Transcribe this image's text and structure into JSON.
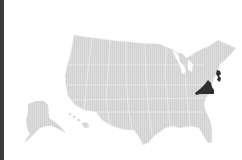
{
  "map": {
    "type": "us-states-choropleth",
    "highlighted_states": [
      "Virginia",
      "New Jersey"
    ],
    "colors": {
      "highlight": "#2e2e2e",
      "default": "#d9d9d9",
      "border": "#f2f2f2",
      "background": "#ffffff"
    }
  }
}
